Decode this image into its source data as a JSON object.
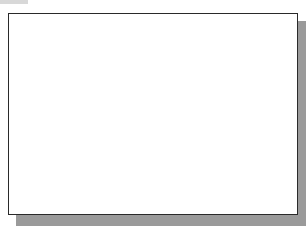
{
  "figure": {
    "label": "1.5",
    "colors": {
      "line": "#2b2b2b",
      "grid": "#c8c8c8",
      "axis": "#555555",
      "arc": "#777777",
      "shadow": "#9a9a9a"
    },
    "grid": {
      "vertical_lines_x": [
        23,
        50,
        76,
        102,
        129,
        183,
        209,
        236,
        263,
        290
      ],
      "horizontal_lines_y": [
        20,
        47,
        74,
        101,
        128,
        155,
        182,
        209
      ],
      "center_axis_x": 156
    },
    "vertex": {
      "x": 42,
      "y": 153
    },
    "upper_ray_end": {
      "x": 245,
      "y": 45
    },
    "lower_ray_end": {
      "x": 271,
      "y": 193
    },
    "arc_points": [
      [
        171,
        16
      ],
      [
        195,
        50
      ],
      [
        212,
        85
      ],
      [
        222,
        120
      ],
      [
        226,
        160
      ],
      [
        224,
        188
      ],
      [
        218,
        215
      ]
    ],
    "intersection": {
      "x": 225,
      "y": 186
    }
  }
}
